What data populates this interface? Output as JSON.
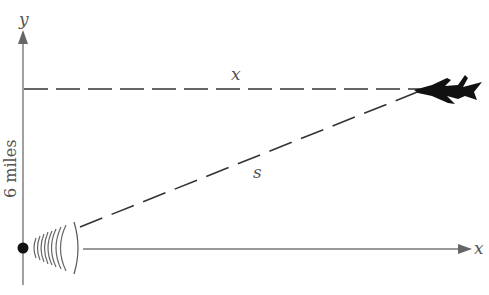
{
  "diagram": {
    "axes": {
      "y_label": "y",
      "x_label": "x"
    },
    "labels": {
      "horizontal_distance": "x",
      "slant_distance": "s",
      "altitude": "6 miles"
    },
    "elements": {
      "radar_station": "radar-station",
      "aircraft": "jet-aircraft"
    },
    "colors": {
      "axis": "#666666",
      "dashed": "#333333",
      "aircraft": "#111111",
      "text": "#555555"
    }
  }
}
